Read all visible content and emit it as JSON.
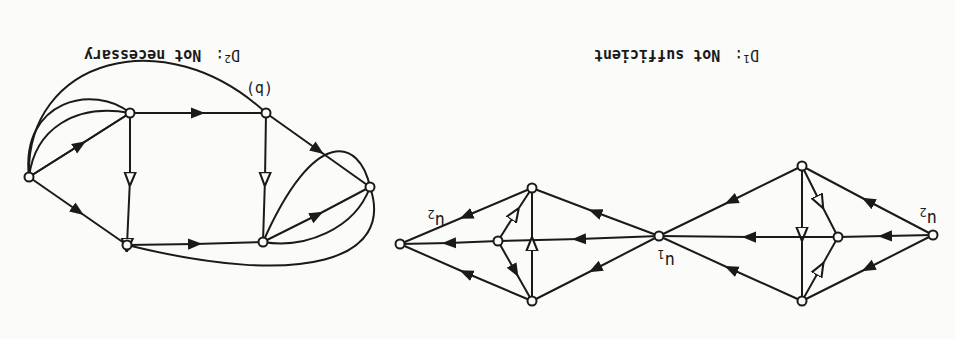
{
  "orientation": "rotated-180",
  "figure_label": "(b)",
  "diagrams": {
    "d1": {
      "title": "D",
      "subscript": "1",
      "colon": ":",
      "caption": "Not sufficient",
      "node_labels": {
        "u1": "u",
        "u1_sub": "1",
        "u2_left": "u",
        "u2_left_sub": "2",
        "u2_right": "u",
        "u2_right_sub": "2"
      }
    },
    "d2": {
      "title": "D",
      "subscript": "2",
      "colon": ":",
      "caption": "Not necessary"
    }
  },
  "colors": {
    "ink": "#1a1a1a",
    "paper": "#fbfbf9"
  }
}
